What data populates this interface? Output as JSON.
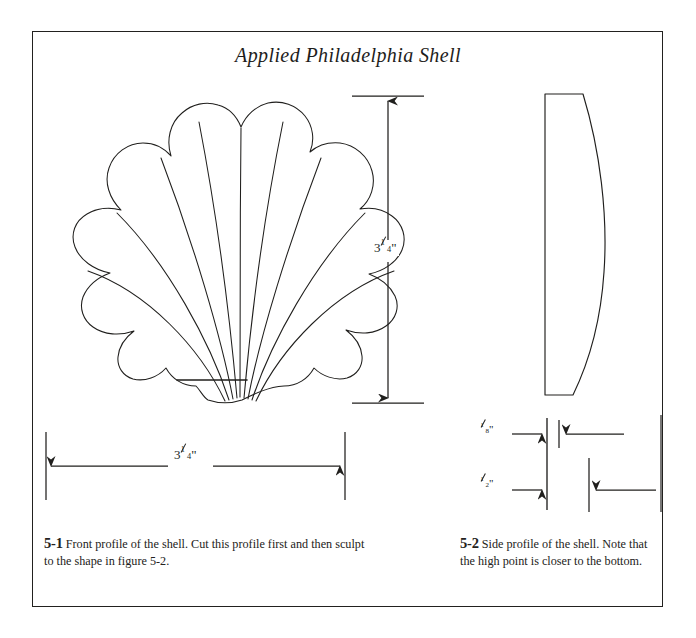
{
  "page": {
    "title": "Applied Philadelphia Shell",
    "border_color": "#22211f",
    "ink_color": "#201f1d",
    "background": "#ffffff"
  },
  "figures": {
    "front": {
      "name": "front-profile-shell",
      "label": "5-1",
      "caption": "Front profile of the shell. Cut this profile first and then sculpt to the shape in figure 5-2.",
      "lobes": 9
    },
    "side": {
      "name": "side-profile-shell",
      "label": "5-2",
      "caption": "Side profile of the shell. Note that the high point is closer to the bottom."
    }
  },
  "dimensions": {
    "height": {
      "whole": "3",
      "numerator": "1",
      "denominator": "4",
      "unit": "\"",
      "text": "3 1/4\"",
      "orientation": "vertical"
    },
    "width": {
      "whole": "3",
      "numerator": "1",
      "denominator": "4",
      "unit": "\"",
      "text": "3 1/4\"",
      "orientation": "horizontal"
    },
    "thickness_top": {
      "whole": "",
      "numerator": "1",
      "denominator": "8",
      "unit": "\"",
      "text": "1/8\"",
      "orientation": "horizontal"
    },
    "thickness_bottom": {
      "whole": "",
      "numerator": "1",
      "denominator": "2",
      "unit": "\"",
      "text": "1/2\"",
      "orientation": "horizontal"
    }
  }
}
